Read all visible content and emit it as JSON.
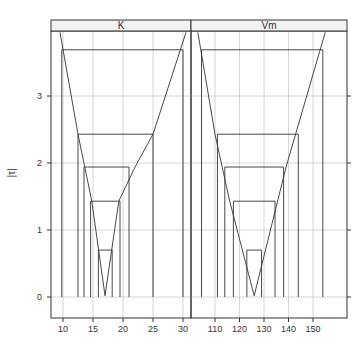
{
  "chart_data": {
    "type": "line",
    "title": "",
    "ylabel": "|τ|",
    "ylabel_display": "|τ|",
    "y_ticks": [
      0,
      1,
      2,
      3
    ],
    "ylim": [
      -0.1,
      3.97
    ],
    "grid": true,
    "legend": null,
    "panels": [
      {
        "strip_label": "K",
        "xlim": [
          7,
          31.3
        ],
        "x_ticks": [
          10,
          15,
          20,
          25,
          30
        ],
        "profile": {
          "x": [
            9.5,
            12.5,
            14.8,
            17.0,
            19.3,
            22.0,
            25.0,
            30.5
          ],
          "y": [
            3.95,
            2.43,
            1.43,
            0.02,
            1.43,
            1.94,
            2.43,
            3.95
          ]
        },
        "vertex": {
          "x": 17.0,
          "y": 0.02
        },
        "intervals": [
          {
            "level": 0.7,
            "lower": 15.9,
            "upper": 18.2
          },
          {
            "level": 1.43,
            "lower": 14.6,
            "upper": 19.5
          },
          {
            "level": 1.94,
            "lower": 13.5,
            "upper": 21.0
          },
          {
            "level": 2.43,
            "lower": 12.5,
            "upper": 25.0
          },
          {
            "level": 3.69,
            "lower": 9.8,
            "upper": 30.0
          }
        ]
      },
      {
        "strip_label": "Vm",
        "xlim": [
          101,
          158
        ],
        "x_ticks": [
          110,
          120,
          130,
          140,
          150
        ],
        "profile": {
          "x": [
            103,
            110,
            116,
            126,
            139,
            155
          ],
          "y": [
            3.95,
            2.43,
            1.43,
            0.02,
            1.94,
            3.95
          ]
        },
        "vertex": {
          "x": 126,
          "y": 0.02
        },
        "intervals": [
          {
            "level": 0.7,
            "lower": 123.0,
            "upper": 129.0
          },
          {
            "level": 1.43,
            "lower": 117.5,
            "upper": 134.5
          },
          {
            "level": 1.94,
            "lower": 114.0,
            "upper": 138.0
          },
          {
            "level": 2.43,
            "lower": 111.0,
            "upper": 144.0
          },
          {
            "level": 3.69,
            "lower": 104.5,
            "upper": 154.0
          }
        ]
      }
    ]
  },
  "layout": {
    "colors": {
      "line": "#333333",
      "grid": "#cccccc",
      "strip_bg": "#f2f2f2",
      "axis": "#333333",
      "text": "#333333"
    }
  }
}
